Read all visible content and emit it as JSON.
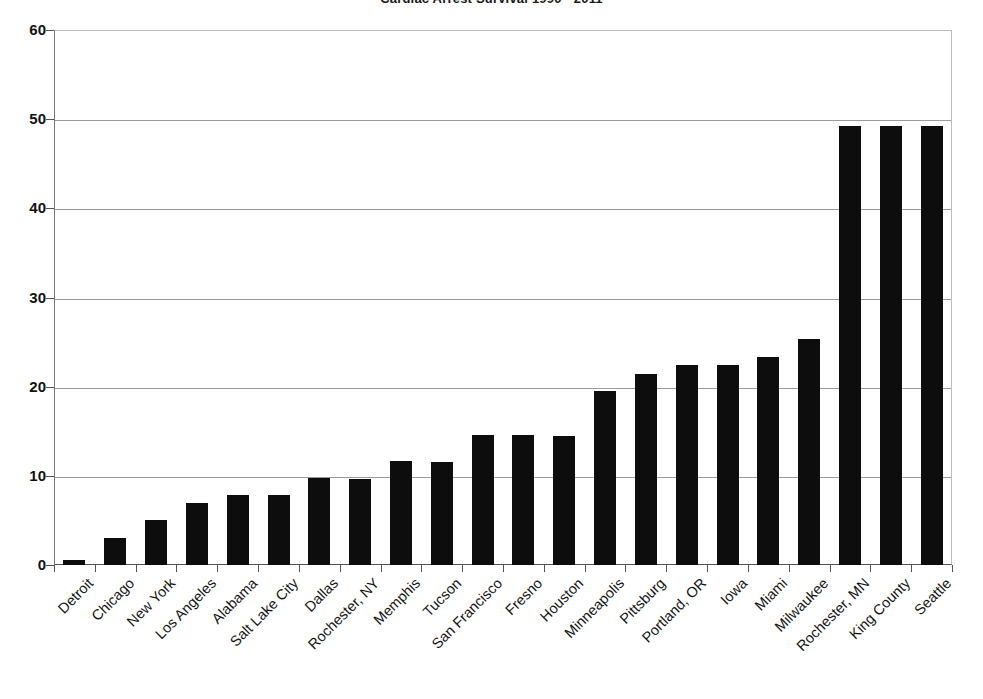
{
  "chart": {
    "title": "Cardiac Arrest Survival 1990 - 2011"
  },
  "chart_data": {
    "type": "bar",
    "title": "Cardiac Arrest Survival 1990 - 2011",
    "xlabel": "",
    "ylabel": "",
    "ylim": [
      0,
      60
    ],
    "yticks": [
      0,
      10,
      20,
      30,
      40,
      50,
      60
    ],
    "grid": true,
    "legend": "none",
    "bar_color": "#0d0d0d",
    "categories": [
      "Detroit",
      "Chicago",
      "New York",
      "Los Angeles",
      "Alabama",
      "Salt Lake City",
      "Dallas",
      "Rochester, NY",
      "Memphis",
      "Tucson",
      "San Francisco",
      "Fresno",
      "Houston",
      "Minneapolis",
      "Pittsburg",
      "Portland, OR",
      "Iowa",
      "Miami",
      "Milwaukee",
      "Rochester, MN",
      "King County",
      "Seattle"
    ],
    "values": [
      0.6,
      3.0,
      5.0,
      6.9,
      7.9,
      7.8,
      9.8,
      9.7,
      11.7,
      11.6,
      14.6,
      14.6,
      14.5,
      19.5,
      21.4,
      22.4,
      22.4,
      23.3,
      25.3,
      49.2,
      49.2,
      49.2
    ]
  }
}
